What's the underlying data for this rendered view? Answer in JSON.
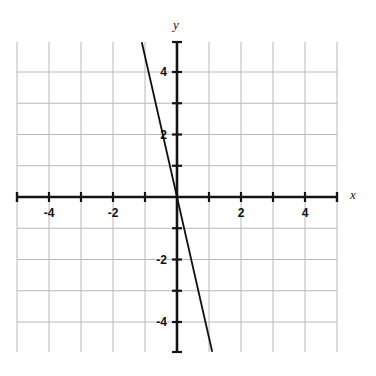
{
  "figure": {
    "kind": "coordinate-plane-line-graph",
    "width": 376,
    "height": 376,
    "background_color": "#ffffff"
  },
  "chart_data": {
    "type": "line",
    "title": "",
    "subtitle": "",
    "xlabel": "x",
    "ylabel": "y",
    "xlim": [
      -5,
      5
    ],
    "ylim": [
      -5,
      5
    ],
    "grid": true,
    "grid_step": 1,
    "grid_color": "#b8b8b8",
    "axis_color": "#141414",
    "legend": "none",
    "tick_step": 1,
    "labeled_tick_step": 2,
    "x_tick_labels": [
      "-4",
      "-2",
      "2",
      "4"
    ],
    "x_tick_values": [
      -4,
      -2,
      2,
      4
    ],
    "y_tick_labels": [
      "4",
      "2",
      "-2",
      "-4"
    ],
    "y_tick_values": [
      4,
      2,
      -2,
      -4
    ],
    "series": [
      {
        "name": "line",
        "color": "#111111",
        "slope": -4.5,
        "intercept": 0,
        "equation": "y = -4.5x",
        "x": [
          -1.1,
          1.1
        ],
        "values": [
          4.95,
          -4.95
        ],
        "points": [
          {
            "x": -1.1,
            "y": 4.95
          },
          {
            "x": 0,
            "y": 0
          },
          {
            "x": 1.1,
            "y": -4.95
          }
        ]
      }
    ],
    "annotations": []
  },
  "axes": {
    "x_axis_label": "x",
    "y_axis_label": "y"
  },
  "geometry": {
    "origin_px": {
      "x": 177,
      "y": 197
    },
    "unit_px_x": 32,
    "unit_px_y": 31.25,
    "grid_left_px": 17,
    "grid_right_px": 337,
    "grid_top_px": 42,
    "grid_bottom_px": 352,
    "x_axis_start_px": 17,
    "x_axis_end_px": 337,
    "y_axis_start_px": 42,
    "y_axis_end_px": 352,
    "line_start_px": {
      "x": 145,
      "y": 42
    },
    "line_end_px": {
      "x": 212,
      "y": 352
    }
  }
}
